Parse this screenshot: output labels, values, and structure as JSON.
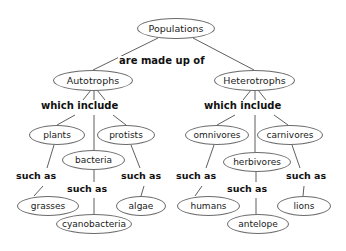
{
  "diagram": {
    "background_color": "#ffffff",
    "node_stroke_color": "#6b6b6b",
    "edge_color": "#4d4d4d",
    "text_color": "#1a1a1a",
    "nodes": [
      {
        "id": "populations",
        "label": "Populations",
        "x": 137,
        "y": 18,
        "w": 78,
        "h": 21,
        "font_size": 9.5
      },
      {
        "id": "autotrophs",
        "label": "Autotrophs",
        "x": 53,
        "y": 70,
        "w": 80,
        "h": 21,
        "font_size": 9.5
      },
      {
        "id": "heterotrophs",
        "label": "Heterotrophs",
        "x": 214,
        "y": 70,
        "w": 81,
        "h": 21,
        "font_size": 9.5
      },
      {
        "id": "plants",
        "label": "plants",
        "x": 29,
        "y": 125,
        "w": 56,
        "h": 20,
        "font_size": 9
      },
      {
        "id": "protists",
        "label": "protists",
        "x": 97,
        "y": 125,
        "w": 58,
        "h": 20,
        "font_size": 9
      },
      {
        "id": "bacteria",
        "label": "bacteria",
        "x": 62,
        "y": 150,
        "w": 63,
        "h": 20,
        "font_size": 9
      },
      {
        "id": "grasses",
        "label": "grasses",
        "x": 17,
        "y": 196,
        "w": 62,
        "h": 20,
        "font_size": 9
      },
      {
        "id": "cyanobacteria",
        "label": "cyanobacteria",
        "x": 56,
        "y": 214,
        "w": 76,
        "h": 20,
        "font_size": 9
      },
      {
        "id": "algae",
        "label": "algae",
        "x": 116,
        "y": 196,
        "w": 50,
        "h": 20,
        "font_size": 9
      },
      {
        "id": "omnivores",
        "label": "omnivores",
        "x": 185,
        "y": 125,
        "w": 64,
        "h": 20,
        "font_size": 9
      },
      {
        "id": "carnivores",
        "label": "carnivores",
        "x": 257,
        "y": 125,
        "w": 66,
        "h": 20,
        "font_size": 9
      },
      {
        "id": "herbivores",
        "label": "herbivores",
        "x": 223,
        "y": 152,
        "w": 68,
        "h": 20,
        "font_size": 9
      },
      {
        "id": "humans",
        "label": "humans",
        "x": 177,
        "y": 196,
        "w": 63,
        "h": 20,
        "font_size": 9
      },
      {
        "id": "antelope",
        "label": "antelope",
        "x": 227,
        "y": 214,
        "w": 62,
        "h": 20,
        "font_size": 9
      },
      {
        "id": "lions",
        "label": "lions",
        "x": 277,
        "y": 196,
        "w": 54,
        "h": 20,
        "font_size": 9
      }
    ],
    "link_labels": [
      {
        "id": "made-up-of",
        "text": "are made up of",
        "x": 118,
        "y": 56,
        "font_size": 10
      },
      {
        "id": "which-include-left",
        "text": "which include",
        "x": 40,
        "y": 101,
        "font_size": 10
      },
      {
        "id": "which-include-right",
        "text": "which include",
        "x": 203,
        "y": 101,
        "font_size": 10
      },
      {
        "id": "such-as-left-1",
        "text": "such as",
        "x": 15,
        "y": 171,
        "font_size": 9.5
      },
      {
        "id": "such-as-left-2",
        "text": "such as",
        "x": 66,
        "y": 184,
        "font_size": 9.5
      },
      {
        "id": "such-as-left-3",
        "text": "such as",
        "x": 120,
        "y": 171,
        "font_size": 9.5
      },
      {
        "id": "such-as-right-1",
        "text": "such as",
        "x": 175,
        "y": 171,
        "font_size": 9.5
      },
      {
        "id": "such-as-right-2",
        "text": "such as",
        "x": 226,
        "y": 184,
        "font_size": 9.5
      },
      {
        "id": "such-as-right-3",
        "text": "such as",
        "x": 285,
        "y": 171,
        "font_size": 9.5
      }
    ],
    "edges": [
      {
        "id": "populations-autotrophs",
        "from": "Populations",
        "to": "Autotrophs",
        "d": "M 158 38 L 93 70"
      },
      {
        "id": "populations-heterotrophs",
        "from": "Populations",
        "to": "Heterotrophs",
        "d": "M 193 38 L 254 70"
      },
      {
        "id": "autotrophs-plants-a",
        "from": "Autotrophs",
        "to": "plants",
        "d": "M 91 90 L 83 100"
      },
      {
        "id": "autotrophs-plants-b",
        "from": "Autotrophs",
        "to": "plants",
        "d": "M 75 115 L 57 125"
      },
      {
        "id": "autotrophs-bacteria-a",
        "from": "Autotrophs",
        "to": "bacteria",
        "d": "M 94 90 L 94 100"
      },
      {
        "id": "autotrophs-bacteria-b",
        "from": "Autotrophs",
        "to": "bacteria",
        "d": "M 94 115 L 94 150"
      },
      {
        "id": "autotrophs-protists-a",
        "from": "Autotrophs",
        "to": "protists",
        "d": "M 97 90 L 105 100"
      },
      {
        "id": "autotrophs-protists-b",
        "from": "Autotrophs",
        "to": "protists",
        "d": "M 113 115 L 126 125"
      },
      {
        "id": "plants-grasses-a",
        "from": "plants",
        "to": "grasses",
        "d": "M 54 145 L 47 168"
      },
      {
        "id": "plants-grasses-b",
        "from": "plants",
        "to": "grasses",
        "d": "M 43 186 L 34 196"
      },
      {
        "id": "bacteria-cyanobacteria-a",
        "from": "bacteria",
        "to": "cyanobacteria",
        "d": "M 94 170 L 94 182"
      },
      {
        "id": "bacteria-cyanobacteria-b",
        "from": "bacteria",
        "to": "cyanobacteria",
        "d": "M 94 198 L 94 214"
      },
      {
        "id": "protists-algae-a",
        "from": "protists",
        "to": "algae",
        "d": "M 131 145 L 140 168"
      },
      {
        "id": "protists-algae-b",
        "from": "protists",
        "to": "algae",
        "d": "M 144 186 L 141 196"
      },
      {
        "id": "heterotrophs-omnivores-a",
        "from": "Heterotrophs",
        "to": "omnivores",
        "d": "M 251 90 L 243 100"
      },
      {
        "id": "heterotrophs-omnivores-b",
        "from": "Heterotrophs",
        "to": "omnivores",
        "d": "M 235 115 L 217 125"
      },
      {
        "id": "heterotrophs-herbivores-a",
        "from": "Heterotrophs",
        "to": "herbivores",
        "d": "M 255 90 L 255 100"
      },
      {
        "id": "heterotrophs-herbivores-b",
        "from": "Heterotrophs",
        "to": "herbivores",
        "d": "M 255 115 L 255 152"
      },
      {
        "id": "heterotrophs-carnivores-a",
        "from": "Heterotrophs",
        "to": "carnivores",
        "d": "M 258 90 L 266 100"
      },
      {
        "id": "heterotrophs-carnivores-b",
        "from": "Heterotrophs",
        "to": "carnivores",
        "d": "M 274 115 L 288 125"
      },
      {
        "id": "omnivores-humans-a",
        "from": "omnivores",
        "to": "humans",
        "d": "M 214 145 L 206 168"
      },
      {
        "id": "omnivores-humans-b",
        "from": "omnivores",
        "to": "humans",
        "d": "M 202 186 L 195 196"
      },
      {
        "id": "herbivores-antelope-a",
        "from": "herbivores",
        "to": "antelope",
        "d": "M 256 172 L 256 182"
      },
      {
        "id": "herbivores-antelope-b",
        "from": "herbivores",
        "to": "antelope",
        "d": "M 256 198 L 256 214"
      },
      {
        "id": "carnivores-lions-a",
        "from": "carnivores",
        "to": "lions",
        "d": "M 292 145 L 300 168"
      },
      {
        "id": "carnivores-lions-b",
        "from": "carnivores",
        "to": "lions",
        "d": "M 304 186 L 303 196"
      }
    ]
  }
}
